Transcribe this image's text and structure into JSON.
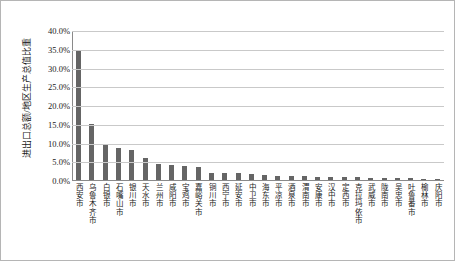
{
  "chart_data": {
    "type": "bar",
    "title": "",
    "xlabel": "",
    "ylabel": "进出口总额/地区生产总值比重",
    "ylim": [
      0,
      0.4
    ],
    "ytick_labels": [
      "40.0%",
      "35.0%",
      "30.0%",
      "25.0%",
      "20.0%",
      "15.0%",
      "10.0%",
      "5.0%",
      "0.0%"
    ],
    "ytick_values": [
      40.0,
      35.0,
      30.0,
      25.0,
      20.0,
      15.0,
      10.0,
      5.0,
      0.0
    ],
    "grid": true,
    "legend": false,
    "bar_color": "#656565",
    "gridline_color": "#c9c9c9",
    "axis_color": "#8a8a8a",
    "categories": [
      "西安市",
      "乌鲁木齐市",
      "白银市",
      "石嘴山市",
      "银川市",
      "天水市",
      "兰州市",
      "咸阳市",
      "宝鸡市",
      "嘉峪关市",
      "铜川市",
      "西宁市",
      "延安市",
      "中卫市",
      "海东市",
      "平凉市",
      "酒泉市",
      "渭南市",
      "安康市",
      "汉中市",
      "定西市",
      "克拉玛依市",
      "武威市",
      "陇南市",
      "吴忠市",
      "吐鲁番市",
      "榆林市",
      "庆阳市"
    ],
    "values": [
      34.8,
      15.0,
      9.7,
      8.5,
      8.1,
      6.0,
      4.2,
      4.1,
      3.7,
      3.5,
      2.0,
      1.9,
      1.8,
      1.5,
      1.3,
      1.2,
      1.1,
      1.0,
      0.9,
      0.85,
      0.8,
      0.7,
      0.6,
      0.55,
      0.5,
      0.45,
      0.35,
      0.3
    ],
    "value_unit": "%"
  }
}
